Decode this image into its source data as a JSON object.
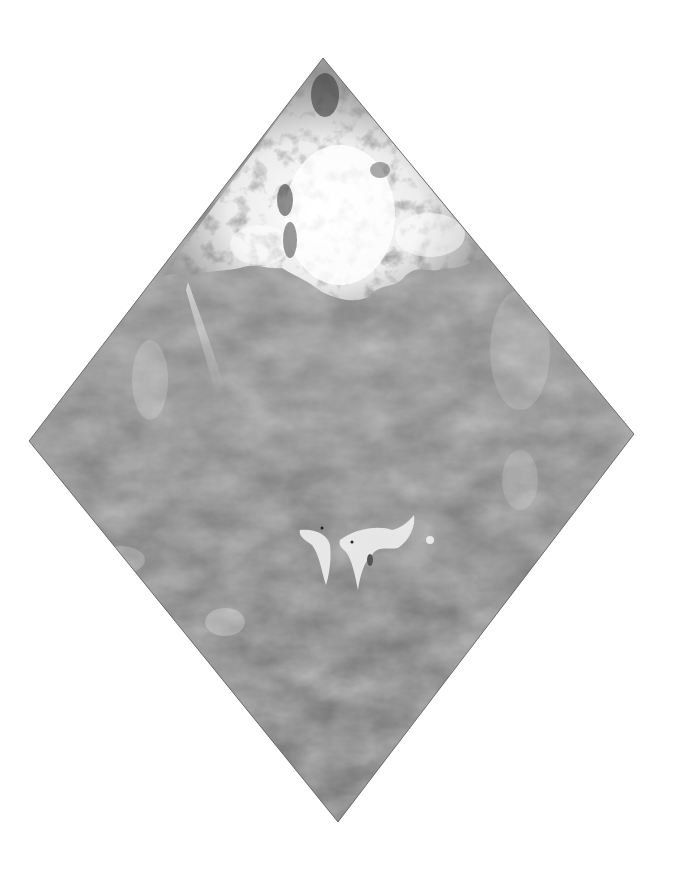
{
  "artwork": {
    "subject": "diamond-shaped grayscale watercolor painting",
    "shape": "rhombus",
    "vertices": {
      "top": [
        323,
        58
      ],
      "left": [
        29,
        441
      ],
      "right": [
        634,
        434
      ],
      "bottom": [
        338,
        822
      ]
    },
    "colors": {
      "background": "#ffffff",
      "body_gray": "#8a8a8a",
      "dark_gray": "#555555",
      "highlight": "#f2f2f2",
      "edge": "#3a3a3a"
    },
    "regions": [
      "textured-cap-top",
      "wash-body",
      "drip-highlight-center"
    ]
  }
}
